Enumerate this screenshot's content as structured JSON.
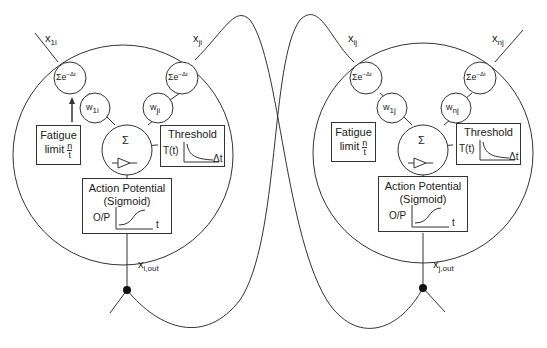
{
  "neurons": [
    {
      "id": "i",
      "inputs": [
        {
          "label": "x",
          "sub": "1i",
          "weight": "w",
          "weight_sub": "1i",
          "integrator": "Σe",
          "integrator_sup": "−Δt"
        },
        {
          "label": "x",
          "sub": "ji",
          "weight": "w",
          "weight_sub": "ji",
          "integrator": "Σe",
          "integrator_sup": "−Δt"
        }
      ],
      "fatigue": {
        "line1": "Fatigue",
        "line2": "limit",
        "num": "n",
        "den": "t"
      },
      "threshold": {
        "title": "Threshold",
        "ylabel": "T(t)",
        "xlabel": "Δt"
      },
      "summation": "Σ",
      "action": {
        "line1": "Action Potential",
        "line2": "(Sigmoid)",
        "ylabel": "O/P",
        "xlabel": "t"
      },
      "output": {
        "label": "x",
        "sub": "i,out"
      }
    },
    {
      "id": "j",
      "inputs": [
        {
          "label": "x",
          "sub": "ij",
          "weight": "w",
          "weight_sub": "1j",
          "integrator": "Σe",
          "integrator_sup": "−Δt"
        },
        {
          "label": "x",
          "sub": "nj",
          "weight": "w",
          "weight_sub": "nj",
          "integrator": "Σe",
          "integrator_sup": "−Δt"
        }
      ],
      "fatigue": {
        "line1": "Fatigue",
        "line2": "limit",
        "num": "n",
        "den": "t"
      },
      "threshold": {
        "title": "Threshold",
        "ylabel": "T(t)",
        "xlabel": "Δt"
      },
      "summation": "Σ",
      "action": {
        "line1": "Action Potential",
        "line2": "(Sigmoid)",
        "ylabel": "O/P",
        "xlabel": "t"
      },
      "output": {
        "label": "x",
        "sub": "j,out"
      }
    }
  ]
}
